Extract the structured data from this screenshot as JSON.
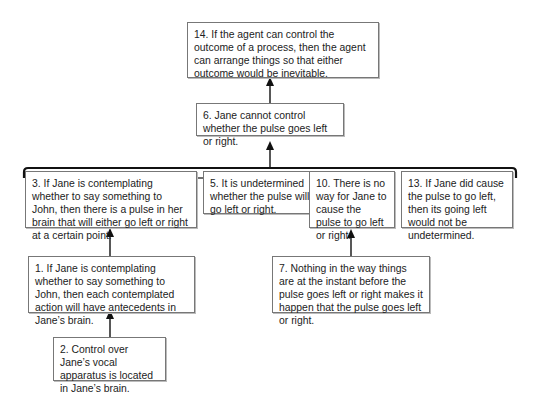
{
  "diagram": {
    "type": "argument-map",
    "nodes": [
      {
        "id": "14",
        "text": "14. If the agent can control the outcome of a process, then the agent can arrange things so that either outcome would be inevitable."
      },
      {
        "id": "6",
        "text": "6. Jane cannot control whether the pulse goes left or right."
      },
      {
        "id": "3",
        "text": "3. If Jane is contemplating whether to say something to John, then there is a pulse in her brain that will either go left or right at a certain point."
      },
      {
        "id": "5",
        "text": "5. It is undetermined whether the pulse will go left or right."
      },
      {
        "id": "10",
        "text": "10. There is no way for Jane to cause the pulse to go left or right."
      },
      {
        "id": "13",
        "text": "13. If Jane did cause the pulse to go left, then its going left would not be undetermined."
      },
      {
        "id": "1",
        "text": "1. If Jane is contemplating whether to say something to John, then each contemplated action will have antecedents in Jane’s brain."
      },
      {
        "id": "7",
        "text": "7. Nothing in the way things are at the instant before the pulse goes left or right makes it happen that the pulse goes left or right."
      },
      {
        "id": "2",
        "text": "2. Control over Jane’s vocal apparatus is located in Jane’s brain."
      }
    ],
    "edges": [
      {
        "from": "6",
        "to": "14"
      },
      {
        "from": [
          "3",
          "5",
          "10",
          "13"
        ],
        "to": "6",
        "linked": true
      },
      {
        "from": "1",
        "to": "3"
      },
      {
        "from": "2",
        "to": "1"
      },
      {
        "from": "7",
        "to": "10"
      }
    ]
  }
}
